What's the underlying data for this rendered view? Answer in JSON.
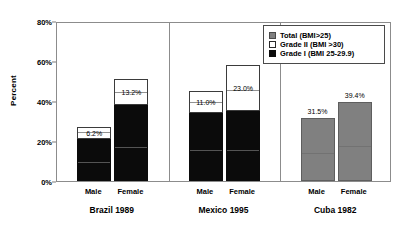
{
  "chart_data": {
    "type": "bar",
    "title": "",
    "subtitle": "",
    "xlabel": "",
    "ylabel": "Percent",
    "ylim": [
      0,
      80
    ],
    "ytick_labels": [
      "0%",
      "20%",
      "40%",
      "60%",
      "80%"
    ],
    "ytick_values": [
      0,
      20,
      40,
      60,
      80
    ],
    "grid": false,
    "stacked": true,
    "legend_position": "top-right",
    "legend": [
      {
        "label": "Total (BMI>25)",
        "swatch": "gray"
      },
      {
        "label": "Grade II (BMI >30)",
        "swatch": "white"
      },
      {
        "label": "Grade I (BMI 25-29.9)",
        "swatch": "black"
      }
    ],
    "groups": [
      {
        "name": "Brazil 1989",
        "categories": [
          "Male",
          "Female"
        ],
        "bars": [
          {
            "category": "Male",
            "total": 27.0,
            "segments": [
              {
                "series": "Grade I (BMI 25-29.9)",
                "value": 20.8,
                "label": ""
              },
              {
                "series": "Grade II (BMI >30)",
                "value": 6.2,
                "label": "6.2%"
              }
            ]
          },
          {
            "category": "Female",
            "total": 51.0,
            "segments": [
              {
                "series": "Grade I (BMI 25-29.9)",
                "value": 37.8,
                "label": ""
              },
              {
                "series": "Grade II (BMI >30)",
                "value": 13.2,
                "label": "13.2%"
              }
            ]
          }
        ]
      },
      {
        "name": "Mexico 1995",
        "categories": [
          "Male",
          "Female"
        ],
        "bars": [
          {
            "category": "Male",
            "total": 45.0,
            "segments": [
              {
                "series": "Grade I (BMI 25-29.9)",
                "value": 34.0,
                "label": ""
              },
              {
                "series": "Grade II (BMI >30)",
                "value": 11.0,
                "label": "11.0%"
              }
            ]
          },
          {
            "category": "Female",
            "total": 58.0,
            "segments": [
              {
                "series": "Grade I (BMI 25-29.9)",
                "value": 35.0,
                "label": ""
              },
              {
                "series": "Grade II (BMI >30)",
                "value": 23.0,
                "label": "23.0%"
              }
            ]
          }
        ]
      },
      {
        "name": "Cuba 1982",
        "categories": [
          "Male",
          "Female"
        ],
        "bars": [
          {
            "category": "Male",
            "total": 31.5,
            "segments": [
              {
                "series": "Total (BMI>25)",
                "value": 31.5,
                "label": "31.5%"
              }
            ]
          },
          {
            "category": "Female",
            "total": 39.4,
            "segments": [
              {
                "series": "Total (BMI>25)",
                "value": 39.4,
                "label": "39.4%"
              }
            ]
          }
        ]
      }
    ]
  },
  "colors": {
    "grade1": "#0b0b0b",
    "grade2": "#ffffff",
    "total": "#808080",
    "axis": "#8c8c8c",
    "text": "#000000"
  }
}
